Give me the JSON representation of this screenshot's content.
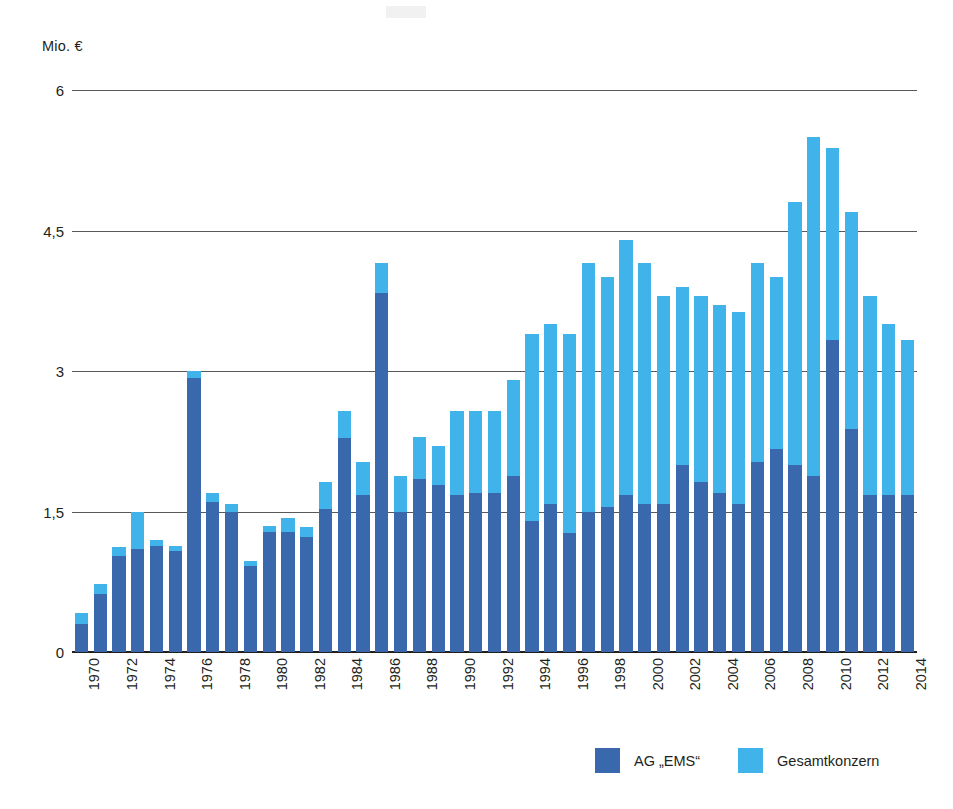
{
  "chart_data": {
    "type": "bar",
    "subtype": "stacked-vertical",
    "title": "",
    "unit_label": "Mio. €",
    "xlabel": "",
    "ylabel": "Mio. €",
    "ylim": [
      0,
      6
    ],
    "yticks": [
      0,
      1.5,
      3,
      4.5,
      6
    ],
    "ytick_labels": [
      "0",
      "1,5",
      "3",
      "4,5",
      "6"
    ],
    "grid": true,
    "grid_axis": "y",
    "legend_position": "bottom-right",
    "stacking_note": "Dark series (AG \"EMS\") is the lower segment; light series (Gesamtkonzern) is the total height of the bar.",
    "colors": {
      "ag_ems": "#3a68ad",
      "gesamtkonzern": "#3fb3ea",
      "gridline": "#58595b",
      "baseline": "#231f20",
      "text": "#231f20",
      "background": "#ffffff"
    },
    "categories": [
      "1970",
      "1971",
      "1972",
      "1973",
      "1974",
      "1975",
      "1976",
      "1977",
      "1978",
      "1979",
      "1980",
      "1981",
      "1982",
      "1983",
      "1984",
      "1985",
      "1986",
      "1987",
      "1988",
      "1989",
      "1990",
      "1991",
      "1992",
      "1993",
      "1994",
      "1995",
      "1996",
      "1997",
      "1998",
      "1999",
      "2000",
      "2001",
      "2002",
      "2003",
      "2004",
      "2005",
      "2006",
      "2007",
      "2008",
      "2009",
      "2010",
      "2011",
      "2012",
      "2013",
      "2014"
    ],
    "xtick_labels": [
      "1970",
      "1972",
      "1974",
      "1976",
      "1978",
      "1980",
      "1982",
      "1984",
      "1986",
      "1988",
      "1990",
      "1992",
      "1994",
      "1996",
      "1998",
      "2000",
      "2002",
      "2004",
      "2006",
      "2008",
      "2010",
      "2012",
      "2014"
    ],
    "series": [
      {
        "name": "AG „EMS“",
        "color": "#3a68ad",
        "values": [
          0.3,
          0.62,
          1.02,
          1.1,
          1.13,
          1.08,
          2.93,
          1.6,
          1.5,
          0.92,
          1.28,
          1.28,
          1.23,
          1.53,
          2.28,
          1.68,
          3.83,
          1.5,
          1.85,
          1.78,
          1.68,
          1.7,
          1.7,
          1.88,
          1.4,
          1.58,
          1.27,
          1.5,
          1.55,
          1.68,
          1.58,
          1.58,
          2.0,
          1.82,
          1.7,
          1.58,
          2.03,
          2.17,
          2.0,
          1.88,
          3.33,
          2.38,
          1.68,
          1.68,
          1.68
        ]
      },
      {
        "name": "Gesamtkonzern",
        "color": "#3fb3ea",
        "values": [
          0.42,
          0.73,
          1.12,
          1.5,
          1.2,
          1.13,
          3.0,
          1.7,
          1.58,
          0.97,
          1.35,
          1.43,
          1.33,
          1.82,
          2.57,
          2.03,
          4.15,
          1.88,
          2.3,
          2.2,
          2.57,
          2.57,
          2.57,
          2.9,
          3.4,
          3.5,
          3.4,
          4.15,
          4.0,
          4.4,
          4.15,
          3.8,
          3.9,
          3.8,
          3.7,
          3.63,
          4.15,
          4.0,
          4.8,
          5.5,
          5.38,
          4.7,
          3.8,
          3.5,
          3.33
        ]
      }
    ]
  },
  "legend": {
    "items": [
      {
        "label": "AG „EMS“",
        "color": "#3a68ad"
      },
      {
        "label": "Gesamtkonzern",
        "color": "#3fb3ea"
      }
    ]
  }
}
